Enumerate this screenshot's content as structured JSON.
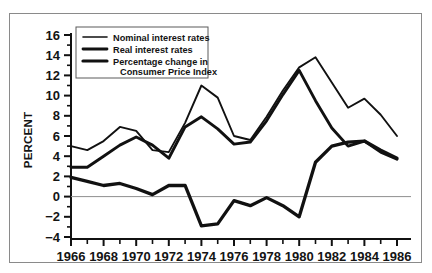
{
  "chart_data": {
    "type": "line",
    "title": "",
    "subtitle": "",
    "xlabel": "",
    "ylabel": "PERCENT",
    "xlim": [
      1966,
      1986
    ],
    "ylim": [
      -4,
      16
    ],
    "ytick_step": 2,
    "xtick_step_major": 2,
    "xtick_step_minor": 1,
    "grid": false,
    "legend_position": "top-left",
    "zero_line": true,
    "x": [
      1966,
      1967,
      1968,
      1969,
      1970,
      1971,
      1972,
      1973,
      1974,
      1975,
      1976,
      1977,
      1978,
      1979,
      1980,
      1981,
      1982,
      1983,
      1984,
      1985,
      1986
    ],
    "categories": [
      "1966",
      "1967",
      "1968",
      "1969",
      "1970",
      "1971",
      "1972",
      "1973",
      "1974",
      "1975",
      "1976",
      "1977",
      "1978",
      "1979",
      "1980",
      "1981",
      "1982",
      "1983",
      "1984",
      "1985",
      "1986"
    ],
    "xticklabels": [
      "1966",
      "1968",
      "1970",
      "1972",
      "1974",
      "1976",
      "1978",
      "1980",
      "1982",
      "1984",
      "1986"
    ],
    "yticklabels": [
      "16",
      "14",
      "12",
      "10",
      "8",
      "6",
      "4",
      "2",
      "0",
      "-2",
      "-4"
    ],
    "series": [
      {
        "name": "Nominal interest rates",
        "style": "solid",
        "color": "#111111",
        "values": [
          5.0,
          4.6,
          5.5,
          6.9,
          6.5,
          4.6,
          4.4,
          7.3,
          11.0,
          9.8,
          6.0,
          5.6,
          7.9,
          10.5,
          12.8,
          13.8,
          11.3,
          8.8,
          9.7,
          8.1,
          6.0
        ]
      },
      {
        "name": "Real interest rates",
        "style": "solid",
        "color": "#111111",
        "values": [
          2.9,
          2.9,
          4.0,
          5.1,
          5.9,
          5.1,
          3.8,
          6.9,
          7.9,
          6.7,
          5.2,
          5.4,
          7.5,
          10.1,
          12.5,
          9.5,
          6.8,
          5.0,
          5.5,
          4.4,
          3.7
        ]
      },
      {
        "name": "Percentage change in Consumer Price Index",
        "style": "solid",
        "color": "#111111",
        "values": [
          1.9,
          1.5,
          1.1,
          1.3,
          0.8,
          0.2,
          1.1,
          1.1,
          -2.9,
          -2.7,
          -0.4,
          -0.9,
          -0.1,
          -0.9,
          -2.0,
          3.4,
          5.0,
          5.4,
          5.5,
          4.6,
          3.8
        ]
      }
    ]
  },
  "legend": {
    "entries": [
      {
        "label_line1": "Nominal interest rates",
        "label_line2": ""
      },
      {
        "label_line1": "Real interest rates",
        "label_line2": ""
      },
      {
        "label_line1": "Percentage change in",
        "label_line2": "Consumer Price Index"
      }
    ]
  },
  "axes": {
    "ylabel": "PERCENT",
    "yticks": [
      "16",
      "14",
      "12",
      "10",
      "8",
      "6",
      "4",
      "2",
      "0",
      "-2",
      "-4"
    ],
    "xticks": [
      "1966",
      "1968",
      "1970",
      "1972",
      "1974",
      "1976",
      "1978",
      "1980",
      "1982",
      "1984",
      "1986"
    ]
  }
}
